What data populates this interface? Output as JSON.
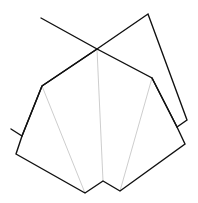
{
  "diagram": {
    "width": 198,
    "height": 203,
    "background": "#ffffff",
    "stroke_color": "#111111",
    "fold_line_color": "#b8b8b8",
    "stroke_width": 1.4,
    "fold_line_width": 0.7,
    "back_left_square": {
      "points": [
        [
          41,
          18
        ],
        [
          97,
          49
        ],
        [
          42,
          86
        ],
        [
          22,
          136
        ],
        [
          11,
          129
        ]
      ]
    },
    "back_right_square": {
      "points": [
        [
          97,
          49
        ],
        [
          148,
          14
        ],
        [
          187,
          120
        ],
        [
          177,
          127
        ],
        [
          152,
          78
        ]
      ]
    },
    "front_shape": {
      "points": [
        [
          42,
          86
        ],
        [
          97,
          49
        ],
        [
          152,
          78
        ],
        [
          177,
          127
        ],
        [
          185,
          144
        ],
        [
          120,
          191
        ],
        [
          103,
          181
        ],
        [
          85,
          193
        ],
        [
          16,
          154
        ],
        [
          22,
          136
        ]
      ]
    },
    "fold_lines": [
      {
        "from": [
          42,
          86
        ],
        "to": [
          85,
          193
        ]
      },
      {
        "from": [
          97,
          49
        ],
        "to": [
          103,
          181
        ]
      },
      {
        "from": [
          152,
          78
        ],
        "to": [
          120,
          191
        ]
      }
    ]
  }
}
